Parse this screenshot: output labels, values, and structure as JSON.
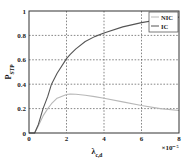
{
  "chart_data": {
    "type": "line",
    "title": "",
    "xlabel": "λ_c,d",
    "xlabel_main": "λ",
    "xlabel_sub": "c,d",
    "x_multiplier": "×10⁻⁵",
    "ylabel": "P_STP",
    "ylabel_main": "P",
    "ylabel_sub": "STP",
    "xlim": [
      0,
      8
    ],
    "ylim": [
      0,
      1
    ],
    "xticks": [
      "0",
      "2",
      "4",
      "6",
      "8"
    ],
    "yticks": [
      "0",
      "0.2",
      "0.4",
      "0.6",
      "0.8",
      "1"
    ],
    "grid": true,
    "legend_position": "upper right",
    "x": [
      0,
      0.3,
      0.5,
      0.75,
      1.0,
      1.2,
      1.5,
      2.0,
      2.2,
      2.5,
      3.0,
      3.5,
      4.0,
      5.0,
      6.0,
      7.0,
      8.0
    ],
    "series": [
      {
        "name": "NIC",
        "color": "#b8b8b8",
        "values": [
          0,
          0,
          0.06,
          0.14,
          0.2,
          0.24,
          0.285,
          0.315,
          0.32,
          0.318,
          0.31,
          0.298,
          0.285,
          0.255,
          0.225,
          0.2,
          0.185
        ]
      },
      {
        "name": "IC",
        "color": "#555555",
        "values": [
          0,
          0,
          0.07,
          0.2,
          0.3,
          0.4,
          0.49,
          0.61,
          0.645,
          0.69,
          0.75,
          0.79,
          0.82,
          0.87,
          0.905,
          0.93,
          0.95
        ]
      }
    ]
  }
}
